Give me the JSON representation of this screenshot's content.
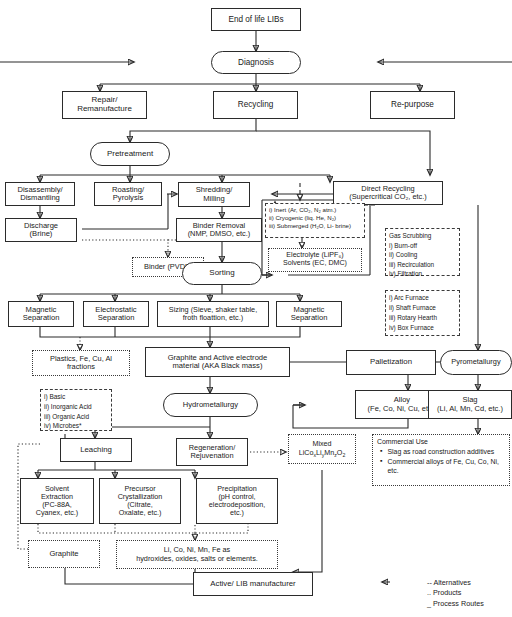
{
  "diagram": {
    "legend": [
      {
        "symbol": "--",
        "label": "Alternatives"
      },
      {
        "symbol": "..",
        "label": "Products"
      },
      {
        "symbol": "_",
        "label": "Process Routes"
      }
    ]
  },
  "nodes": {
    "end_of_life": "End of life LIBs",
    "diagnosis": "Diagnosis",
    "repair": "Repair/\nRemanufacture",
    "recycling": "Recycling",
    "repurpose": "Re-purpose",
    "pretreatment": "Pretreatment",
    "disassembly": "Disassembly/\nDismantling",
    "roasting": "Roasting/\nPyrolysis",
    "shredding": "Shredding/\nMilling",
    "direct_recycling": "Direct Recycling\n(Supercritical CO₂, etc.)",
    "discharge": "Discharge\n(Brine)",
    "binder_removal": "Binder Removal\n(NMP, DMSO, etc.)",
    "binder_pvdf": "Binder (PVDF)",
    "sorting": "Sorting",
    "atmospheres": [
      "i) Inert (Ar, CO₂, N₂ atm.)",
      "ii) Cryogenic (liq. He, N₂)",
      "iii) Submerged (H₂O, Li- brine)"
    ],
    "electrolyte": "Electrolyte (LiPF₆)\nSolvents (EC, DMC)",
    "gas_scrubbing": [
      "Gas Scrubbing",
      "i) Burn-off",
      "ii) Cooling",
      "iii) Recirculation",
      "iv) Filtration"
    ],
    "furnaces": [
      "i) Arc Furnace",
      "ii) Shaft Furnace",
      "iii) Rotary Hearth",
      "iv) Box Furnace"
    ],
    "magnetic_sep_1": "Magnetic\nSeparation",
    "electrostatic_sep": "Electrostatic\nSeparation",
    "sizing": "Sizing (Sieve, shaker table,\nfroth floattion, etc.)",
    "magnetic_sep_2": "Magnetic\nSeparation",
    "plastics": "Plastics, Fe, Cu, Al\nfractions",
    "black_mass": "Graphite and Active electrode\nmaterial (AKA Black mass)",
    "palletization": "Palletization",
    "pyrometallurgy": "Pyrometallurgy",
    "alloy": "Alloy\n(Fe, Co, Ni, Cu, etc.)",
    "slag": "Slag\n(Li, Al, Mn, Cd, etc.)",
    "leach_types": [
      "i) Basic",
      "ii) Inorganic Acid",
      "iii) Organic Acid",
      "iv) Microbes*"
    ],
    "hydrometallurgy": "Hydrometallurgy",
    "leaching": "Leaching",
    "regeneration": "Regeneration/\nRejuvenation",
    "mixed_line1": "Mixed",
    "mixed_formula_parts": [
      "LiCo",
      "x",
      "Li",
      "y",
      "Mn",
      "z",
      "O",
      "2"
    ],
    "commercial_use": {
      "header": "Commercial Use",
      "items": [
        "Slag as road construction additives",
        "Commercial alloys of Fe, Cu, Co, Ni, etc."
      ]
    },
    "solvent_extraction": "Solvent\nExtraction\n(PC-88A,\nCyanex, etc.)",
    "precursor_cryst": "Precursor\nCrystallization\n(Citrate,\nOxalate, etc.)",
    "precipitation": "Precipitation\n(pH control,\nelectrodeposition,\netc.)",
    "graphite": "Graphite",
    "salts": "Li, Co, Ni, Mn, Fe as\nhydroxides, oxides, salts or elements.",
    "active_lib": "Active/ LIB manufacturer"
  }
}
